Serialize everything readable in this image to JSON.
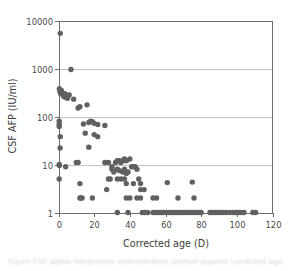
{
  "figure": {
    "caption": "Figure  CSF alpha-fetoprotein concentration plotted against corrected age",
    "caption_visible": false
  },
  "chart_data": {
    "type": "scatter",
    "title": "",
    "xlabel": "Corrected age (D)",
    "ylabel": "CSF AFP (IU/ml)",
    "xscale": "linear",
    "yscale": "log",
    "xlim": [
      0,
      120
    ],
    "ylim": [
      1,
      10000
    ],
    "xticks": [
      0,
      20,
      40,
      60,
      80,
      100,
      120
    ],
    "xtick_labels": [
      "0",
      "20",
      "40",
      "60",
      "80",
      "100",
      "120"
    ],
    "yticks": [
      1,
      10,
      100,
      1000,
      10000
    ],
    "ytick_labels": [
      "1",
      "10",
      "100",
      "1000",
      "10000"
    ],
    "grid": "horizontal",
    "legend": "none",
    "marker": {
      "shape": "circle",
      "color": "#606060",
      "radius_px": 2.7
    },
    "series": [
      {
        "name": "CSF AFP",
        "points": [
          [
            1,
            5400
          ],
          [
            7,
            950
          ],
          [
            0.5,
            380
          ],
          [
            0.8,
            330
          ],
          [
            1.2,
            300
          ],
          [
            1.6,
            350
          ],
          [
            2.2,
            290
          ],
          [
            3.0,
            260
          ],
          [
            3.6,
            300
          ],
          [
            4.2,
            250
          ],
          [
            5.0,
            240
          ],
          [
            6.0,
            280
          ],
          [
            8.5,
            230
          ],
          [
            11,
            150
          ],
          [
            12,
            160
          ],
          [
            16,
            175
          ],
          [
            0.4,
            80
          ],
          [
            0.4,
            68
          ],
          [
            0.4,
            62
          ],
          [
            1.0,
            38
          ],
          [
            0.9,
            22
          ],
          [
            14,
            70
          ],
          [
            17,
            75
          ],
          [
            18,
            80
          ],
          [
            19,
            78
          ],
          [
            20,
            72
          ],
          [
            22,
            68
          ],
          [
            26,
            65
          ],
          [
            15,
            45
          ],
          [
            20,
            42
          ],
          [
            22,
            38
          ],
          [
            17,
            23
          ],
          [
            0.4,
            10
          ],
          [
            0.5,
            9.5
          ],
          [
            4,
            9
          ],
          [
            10,
            11
          ],
          [
            11,
            11
          ],
          [
            0.4,
            5
          ],
          [
            26,
            11
          ],
          [
            28,
            11
          ],
          [
            30,
            9
          ],
          [
            32,
            11
          ],
          [
            33,
            12
          ],
          [
            34,
            12
          ],
          [
            35,
            11
          ],
          [
            36,
            12
          ],
          [
            37,
            13
          ],
          [
            38,
            12
          ],
          [
            40,
            13
          ],
          [
            30,
            8
          ],
          [
            31,
            7
          ],
          [
            33,
            8
          ],
          [
            34,
            7.5
          ],
          [
            36,
            7
          ],
          [
            37,
            8
          ],
          [
            38,
            6.5
          ],
          [
            39,
            7
          ],
          [
            41,
            9
          ],
          [
            42,
            9
          ],
          [
            43,
            9
          ],
          [
            44,
            8
          ],
          [
            28,
            5
          ],
          [
            29,
            5
          ],
          [
            33,
            5
          ],
          [
            35,
            5
          ],
          [
            37,
            5
          ],
          [
            38,
            4
          ],
          [
            42,
            4
          ],
          [
            45,
            5
          ],
          [
            46,
            4
          ],
          [
            12,
            4
          ],
          [
            27,
            3
          ],
          [
            46,
            3
          ],
          [
            48,
            3
          ],
          [
            61,
            4.2
          ],
          [
            75,
            4.3
          ],
          [
            12,
            2
          ],
          [
            12.6,
            2
          ],
          [
            13.2,
            2
          ],
          [
            19,
            2
          ],
          [
            38,
            2
          ],
          [
            40,
            2
          ],
          [
            44,
            2
          ],
          [
            46,
            2
          ],
          [
            53,
            2
          ],
          [
            55,
            2
          ],
          [
            67,
            2
          ],
          [
            76,
            2
          ],
          [
            33,
            1
          ],
          [
            39,
            1
          ],
          [
            47,
            1
          ],
          [
            48.5,
            1
          ],
          [
            50,
            1
          ],
          [
            53,
            1
          ],
          [
            54.5,
            1
          ],
          [
            56,
            1
          ],
          [
            57.5,
            1
          ],
          [
            59,
            1
          ],
          [
            60.5,
            1
          ],
          [
            62,
            1
          ],
          [
            63.5,
            1
          ],
          [
            65,
            1
          ],
          [
            66.5,
            1
          ],
          [
            68,
            1
          ],
          [
            69.5,
            1
          ],
          [
            71,
            1
          ],
          [
            72.5,
            1
          ],
          [
            74,
            1
          ],
          [
            75.5,
            1
          ],
          [
            77,
            1
          ],
          [
            78.5,
            1
          ],
          [
            80,
            1
          ],
          [
            85,
            1
          ],
          [
            86.5,
            1
          ],
          [
            88,
            1
          ],
          [
            89.5,
            1
          ],
          [
            91,
            1
          ],
          [
            92.5,
            1
          ],
          [
            94,
            1
          ],
          [
            96,
            1
          ],
          [
            98,
            1
          ],
          [
            99.5,
            1
          ],
          [
            101,
            1
          ],
          [
            102.5,
            1
          ],
          [
            104,
            1
          ],
          [
            109,
            1
          ],
          [
            110.5,
            1
          ]
        ]
      }
    ]
  }
}
